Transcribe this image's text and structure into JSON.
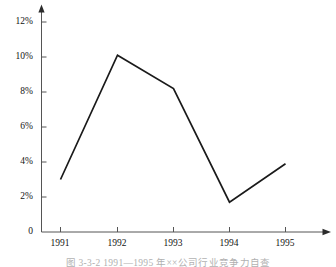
{
  "chart_data": {
    "type": "line",
    "title": "",
    "subtitle": "",
    "xlabel": "",
    "ylabel": "",
    "categories": [
      "1991",
      "1992",
      "1993",
      "1994",
      "1995"
    ],
    "values": [
      3.0,
      10.1,
      8.2,
      1.7,
      3.9
    ],
    "series": [
      {
        "name": "",
        "values": [
          3.0,
          10.1,
          8.2,
          1.7,
          3.9
        ]
      }
    ],
    "x_tick_labels": [
      "1991",
      "1992",
      "1993",
      "1994",
      "1995"
    ],
    "y_tick_labels": [
      "0",
      "2%",
      "4%",
      "6%",
      "8%",
      "10%",
      "12%"
    ],
    "y_tick_values": [
      0,
      2,
      4,
      6,
      8,
      10,
      12
    ],
    "ylim": [
      0,
      12.5
    ],
    "xlim": [
      0,
      6
    ],
    "grid": false,
    "legend": false,
    "legend_position": "none",
    "markers": false,
    "line_color": "#1a1a1a",
    "axis_color": "#555555",
    "background_color": "#ffffff",
    "y_axis_arrow": true,
    "x_axis_arrow": true,
    "units": "percent"
  },
  "axes": {
    "y_ticks": [
      {
        "label": "12%",
        "value": 12
      },
      {
        "label": "10%",
        "value": 10
      },
      {
        "label": "8%",
        "value": 8
      },
      {
        "label": "6%",
        "value": 6
      },
      {
        "label": "4%",
        "value": 4
      },
      {
        "label": "2%",
        "value": 2
      },
      {
        "label": "0",
        "value": 0
      }
    ],
    "x_ticks": [
      {
        "label": "1991"
      },
      {
        "label": "1992"
      },
      {
        "label": "1993"
      },
      {
        "label": "1994"
      },
      {
        "label": "1995"
      }
    ]
  },
  "caption": {
    "text": "图 3-3-2  1991—1995 年××公司行业竞争力自查"
  }
}
